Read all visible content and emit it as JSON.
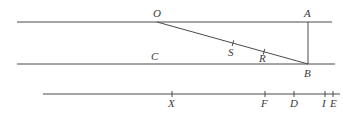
{
  "diagram": {
    "colors": {
      "stroke": "#4a4a4a",
      "text": "#3a3a3a",
      "background": "#ffffff"
    },
    "lines": [
      {
        "id": "top-line",
        "x1": 17,
        "y1": 22,
        "x2": 332,
        "y2": 22
      },
      {
        "id": "middle-line",
        "x1": 17,
        "y1": 64,
        "x2": 335,
        "y2": 64
      },
      {
        "id": "segment-OB",
        "x1": 157,
        "y1": 22,
        "x2": 308,
        "y2": 64
      },
      {
        "id": "segment-AB",
        "x1": 308,
        "y1": 22,
        "x2": 308,
        "y2": 64
      },
      {
        "id": "bottom-line",
        "x1": 43,
        "y1": 94,
        "x2": 340,
        "y2": 94
      }
    ],
    "ticks_on_OB": [
      {
        "label": "S",
        "x": 233
      },
      {
        "label": "R",
        "x": 264
      }
    ],
    "ticks_on_bottom": [
      {
        "label": "X",
        "x": 172
      },
      {
        "label": "F",
        "x": 265
      },
      {
        "label": "D",
        "x": 294
      },
      {
        "label": "I",
        "x": 325
      },
      {
        "label": "E",
        "x": 333
      }
    ],
    "labels": [
      {
        "text": "O",
        "x": 153,
        "y": 17
      },
      {
        "text": "A",
        "x": 304,
        "y": 17
      },
      {
        "text": "C",
        "x": 151,
        "y": 60
      },
      {
        "text": "S",
        "x": 228,
        "y": 56
      },
      {
        "text": "R",
        "x": 259,
        "y": 62
      },
      {
        "text": "B",
        "x": 304,
        "y": 77
      },
      {
        "text": "X",
        "x": 168,
        "y": 107
      },
      {
        "text": "F",
        "x": 261,
        "y": 107
      },
      {
        "text": "D",
        "x": 290,
        "y": 107
      },
      {
        "text": "I",
        "x": 322,
        "y": 107
      },
      {
        "text": "E",
        "x": 330,
        "y": 107
      }
    ]
  }
}
